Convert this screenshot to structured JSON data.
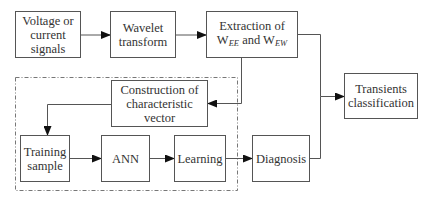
{
  "diagram": {
    "nodes": {
      "input": {
        "lines": [
          "Voltage or",
          "current",
          "signals"
        ]
      },
      "wavelet": {
        "lines": [
          "Wavelet",
          "transform"
        ]
      },
      "extraction": {
        "line1": "Extraction of",
        "w1": "W",
        "w1_sub": "EE",
        "and": " and ",
        "w2": "W",
        "w2_sub": "EW"
      },
      "construction": {
        "lines": [
          "Construction of",
          "characteristic",
          "vector"
        ]
      },
      "training": {
        "lines": [
          "Training",
          "sample"
        ]
      },
      "ann": {
        "lines": [
          "ANN"
        ]
      },
      "learning": {
        "lines": [
          "Learning"
        ]
      },
      "diagnosis": {
        "lines": [
          "Diagnosis"
        ]
      },
      "transients": {
        "lines": [
          "Transients",
          "classification"
        ]
      }
    },
    "edges": [
      {
        "from": "input",
        "to": "wavelet"
      },
      {
        "from": "wavelet",
        "to": "extraction"
      },
      {
        "from": "extraction",
        "to": "construction"
      },
      {
        "from": "extraction",
        "to": "transients"
      },
      {
        "from": "construction",
        "to": "training"
      },
      {
        "from": "training",
        "to": "ann"
      },
      {
        "from": "ann",
        "to": "learning"
      },
      {
        "from": "learning",
        "to": "diagnosis"
      },
      {
        "from": "diagnosis",
        "to": "transients"
      }
    ],
    "group": {
      "style": "dash-dot",
      "contains": [
        "construction",
        "training",
        "ann",
        "learning"
      ]
    }
  }
}
